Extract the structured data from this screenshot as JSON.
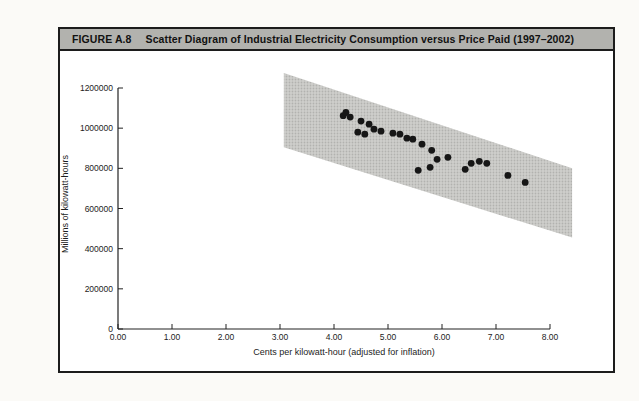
{
  "figure": {
    "label": "FIGURE A.8",
    "title": "Scatter Diagram of Industrial Electricity Consumption versus Price Paid (1997–2002)"
  },
  "colors": {
    "title_bar_bg": "#b2b2ae",
    "figure_border": "#1c1c1c",
    "band_base": "#cfcfcc",
    "band_dot": "#b2b2af",
    "point_color": "#161616",
    "axis_color": "#222222"
  },
  "chart_data": {
    "type": "scatter",
    "title": "Scatter Diagram of Industrial Electricity Consumption versus Price Paid (1997–2002)",
    "xlabel": "Cents per kilowatt-hour (adjusted for inflation)",
    "ylabel": "Millions of kilowatt-hours",
    "xlim": [
      0,
      8
    ],
    "ylim": [
      0,
      1200000
    ],
    "grid": false,
    "x_ticks": [
      0,
      1,
      2,
      3,
      4,
      5,
      6,
      7,
      8
    ],
    "x_tick_labels": [
      "0.00",
      "1.00",
      "2.00",
      "3.00",
      "4.00",
      "5.00",
      "6.00",
      "7.00",
      "8.00"
    ],
    "y_ticks": [
      0,
      200000,
      400000,
      600000,
      800000,
      1000000,
      1200000
    ],
    "y_tick_labels": [
      "0",
      "200000",
      "400000",
      "600000",
      "800000",
      "1000000",
      "1200000"
    ],
    "band_polygon": [
      [
        3.07,
        1275000
      ],
      [
        8.41,
        800000
      ],
      [
        8.41,
        455000
      ],
      [
        3.07,
        905000
      ]
    ],
    "points": [
      [
        4.17,
        1062000
      ],
      [
        4.22,
        1078000
      ],
      [
        4.3,
        1055000
      ],
      [
        4.5,
        1035000
      ],
      [
        4.65,
        1020000
      ],
      [
        4.44,
        980000
      ],
      [
        4.57,
        970000
      ],
      [
        4.74,
        995000
      ],
      [
        4.87,
        985000
      ],
      [
        5.09,
        975000
      ],
      [
        5.22,
        970000
      ],
      [
        5.35,
        950000
      ],
      [
        5.46,
        945000
      ],
      [
        5.63,
        920000
      ],
      [
        5.81,
        890000
      ],
      [
        5.91,
        845000
      ],
      [
        6.11,
        855000
      ],
      [
        5.78,
        805000
      ],
      [
        5.56,
        790000
      ],
      [
        6.43,
        795000
      ],
      [
        6.54,
        825000
      ],
      [
        6.69,
        835000
      ],
      [
        6.83,
        825000
      ],
      [
        7.22,
        765000
      ],
      [
        7.54,
        730000
      ]
    ]
  }
}
